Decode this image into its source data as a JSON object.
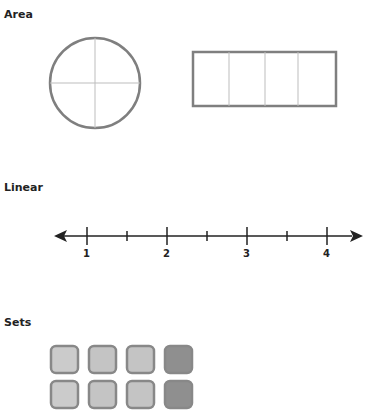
{
  "sections": {
    "area": {
      "title": "Area"
    },
    "linear": {
      "title": "Linear",
      "labels": [
        "1",
        "2",
        "3",
        "4"
      ]
    },
    "sets": {
      "title": "Sets"
    }
  },
  "colors": {
    "outline": "#7f7f7f",
    "divider": "#bdbdbd",
    "axis": "#222222",
    "square_light": "#c9c9c9",
    "square_mid": "#c2c2c2",
    "square_dark": "#8e8e8e",
    "square_border": "#888888"
  }
}
